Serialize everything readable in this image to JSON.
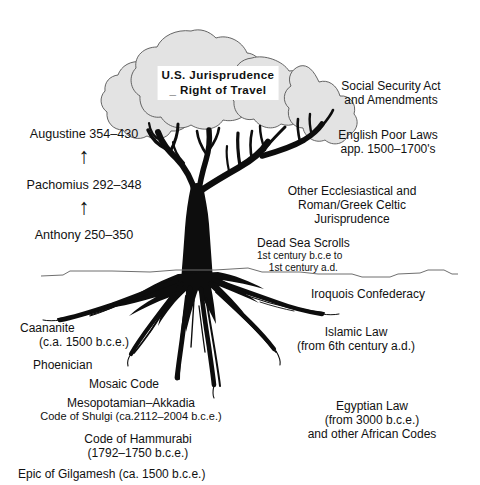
{
  "diagram": {
    "canopy_label": {
      "line1": "U.S. Jurisprudence",
      "line2": "_ Right of Travel"
    },
    "colors": {
      "canopy_fill": "#e3e3e3",
      "canopy_outline": "#4a4a4a",
      "tree_black": "#0d0d0d",
      "ground_line": "#6f6f6f",
      "text": "#111111",
      "background": "#ffffff"
    },
    "left_labels": [
      {
        "text": "Augustine  354–430"
      },
      {
        "text": "Pachomius  292–348"
      },
      {
        "text": "Anthony  250–350"
      }
    ],
    "arrows": [
      {
        "name": "arrow-up-augustine",
        "glyph": "↑"
      },
      {
        "name": "arrow-up-pachomius",
        "glyph": "↑"
      }
    ],
    "right_labels": {
      "social_security": {
        "line1": "Social Security Act",
        "line2": "and Amendments"
      },
      "english_poor_laws": {
        "line1": "English Poor Laws",
        "line2": "app. 1500–1700's"
      },
      "other_ecclesiastical": {
        "line1": "Other Ecclesiastical and",
        "line2": "Roman/Greek Celtic",
        "line3": "Jurisprudence"
      },
      "dead_sea_scrolls": {
        "line1": "Dead Sea Scrolls",
        "line2": "1st century b.c.e to",
        "line3": "1st century a.d."
      },
      "iroquois": {
        "line1": "Iroquois Confederacy"
      },
      "islamic_law": {
        "line1": "Islamic Law",
        "line2": "(from 6th century a.d.)"
      },
      "egyptian_law": {
        "line1": "Egyptian Law",
        "line2": "(from 3000 b.c.e.)",
        "line3": "and other African Codes"
      }
    },
    "root_labels": {
      "caananite": {
        "line1": "Caananite",
        "line2": "(c.a. 1500 b.c.e.)"
      },
      "phoenician": {
        "line1": "Phoenician"
      },
      "mosaic_code": {
        "line1": "Mosaic Code"
      },
      "mesopotamian": {
        "line1": "Mesopotamian–Akkadia",
        "line2": "Code of Shulgi (ca.2112–2004 b.c.e.)"
      },
      "hammurabi": {
        "line1": "Code of Hammurabi",
        "line2": "(1792–1750 b.c.e.)"
      },
      "gilgamesh": {
        "line1": "Epic of Gilgamesh (ca. 1500 b.c.e.)"
      }
    }
  }
}
